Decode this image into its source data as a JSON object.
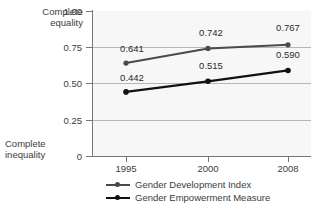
{
  "chart_data": {
    "type": "line",
    "title": "",
    "subtitle": "",
    "xlabel": "",
    "ylabel": "",
    "categories": [
      "1995",
      "2000",
      "2008"
    ],
    "x": [
      1995,
      2000,
      2008
    ],
    "ylim": [
      0,
      1.0
    ],
    "yticks": [
      "0",
      "0.25",
      "0.50",
      "0.75",
      "1.00"
    ],
    "ytick_values": [
      0,
      0.25,
      0.5,
      0.75,
      1.0
    ],
    "grid": true,
    "grid_axis": "y",
    "legend_position": "bottom",
    "axis_captions": {
      "top": "Complete\nequality",
      "bottom": "Complete\ninequality"
    },
    "series": [
      {
        "name": "Gender Development Index",
        "color": "#4a4a4a",
        "values": [
          0.641,
          0.742,
          0.767
        ],
        "labels": [
          "0.641",
          "0.742",
          "0.767"
        ]
      },
      {
        "name": "Gender Empowerment Measure",
        "color": "#111111",
        "values": [
          0.442,
          0.515,
          0.59
        ],
        "labels": [
          "0.442",
          "0.515",
          "0.590"
        ]
      }
    ]
  },
  "legend": {
    "items": [
      {
        "label": "Gender Development Index",
        "color": "#4a4a4a"
      },
      {
        "label": "Gender Empowerment Measure",
        "color": "#111111"
      }
    ]
  },
  "colors": {
    "plot_background": "#f7f7f7",
    "gridline": "#b6b6b6",
    "axis": "#777777",
    "text": "#3c3c3c"
  }
}
